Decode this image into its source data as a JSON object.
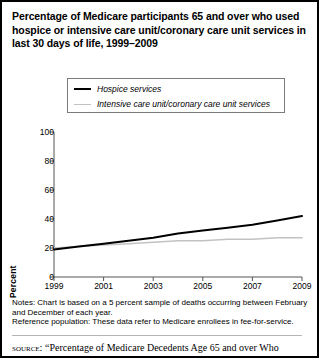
{
  "title": {
    "lines": [
      "Percentage of Medicare participants 65 and over who used",
      "hospice or intensive care unit/coronary care unit services in",
      "last 30 days of life, 1999–2009"
    ]
  },
  "legend": {
    "position": "top-center",
    "items": [
      {
        "label": "Hospice services",
        "color": "#000000"
      },
      {
        "label": "Intensive care unit/coronary care unit services",
        "color": "#c2c2c2"
      }
    ]
  },
  "footnotes": {
    "lines": [
      "Notes: Chart is based on a 5 percent sample of deaths occurring between February",
      "and December of each year.",
      "Reference population: These data refer to Medicare enrollees in fee-for-service."
    ]
  },
  "source": {
    "kicker": "source:",
    "text": "“Percentage of Medicare Decedents Age 65 and over Who"
  },
  "chart_data": {
    "type": "line",
    "title": "Percentage of Medicare participants 65 and over who used hospice or intensive care unit/coronary care unit services in last 30 days of life, 1999–2009",
    "xlabel": "",
    "ylabel": "Percent",
    "x": [
      1999,
      2000,
      2001,
      2002,
      2003,
      2004,
      2005,
      2006,
      2007,
      2008,
      2009
    ],
    "xlim": [
      1999,
      2009
    ],
    "ylim": [
      0,
      100
    ],
    "xticks": [
      1999,
      2001,
      2003,
      2005,
      2007,
      2009
    ],
    "xtick_labels": [
      "1999",
      "2001",
      "2003",
      "2005",
      "2007",
      "2009"
    ],
    "yticks": [
      0,
      20,
      40,
      60,
      80,
      100
    ],
    "ytick_labels": [
      "0",
      "20",
      "40",
      "60",
      "80",
      "100"
    ],
    "grid": false,
    "series": [
      {
        "name": "Hospice services",
        "color": "#000000",
        "width": 2,
        "values": [
          19,
          21,
          23,
          25,
          27,
          30,
          32,
          34,
          36,
          39,
          42
        ]
      },
      {
        "name": "Intensive care unit/coronary care unit services",
        "color": "#c2c2c2",
        "width": 1.5,
        "values": [
          20,
          21,
          22,
          23,
          24,
          25,
          25,
          26,
          26,
          27,
          27
        ]
      }
    ]
  }
}
